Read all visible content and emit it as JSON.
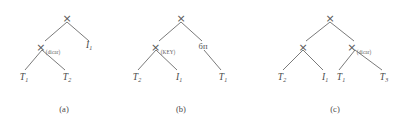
{
  "figure": {
    "background_color": "#ffffff",
    "line_color": "#6b6b6b",
    "text_color": "#4a4a4a",
    "trees": [
      {
        "id": "a",
        "caption": "(a)",
        "root": {
          "label": "×",
          "subscript": ""
        },
        "internal": [
          {
            "label": "×",
            "subscript": "(dicar)"
          }
        ],
        "right_child_label": "I",
        "right_child_sub": "1",
        "leaves": [
          {
            "base": "T",
            "sub": "1"
          },
          {
            "base": "T",
            "sub": "2"
          }
        ]
      },
      {
        "id": "b",
        "caption": "(b)",
        "root": {
          "label": "×",
          "subscript": ""
        },
        "internal": [
          {
            "label": "×",
            "subscript": "(KEY)"
          }
        ],
        "right_child_label": "бп",
        "right_child_sub": "",
        "leaves": [
          {
            "base": "T",
            "sub": "2"
          },
          {
            "base": "I",
            "sub": "1"
          },
          {
            "base": "T",
            "sub": "1"
          }
        ]
      },
      {
        "id": "c",
        "caption": "(c)",
        "root": {
          "label": "×",
          "subscript": ""
        },
        "internal": [
          {
            "label": "×",
            "subscript": ""
          },
          {
            "label": "×",
            "subscript": "(dicar)"
          }
        ],
        "right_child_label": "",
        "right_child_sub": "",
        "leaves": [
          {
            "base": "T",
            "sub": "2"
          },
          {
            "base": "I",
            "sub": "1"
          },
          {
            "base": "T",
            "sub": "1"
          },
          {
            "base": "T",
            "sub": "3"
          }
        ]
      }
    ]
  }
}
